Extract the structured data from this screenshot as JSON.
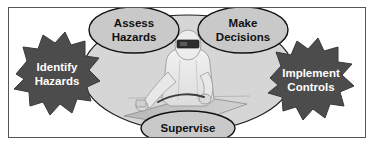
{
  "diagram": {
    "frame": {
      "border_color": "#555555",
      "background_color": "#ffffff"
    },
    "center": {
      "oval_fill": "#d6d6d6",
      "figure_name": "welder-illustration",
      "figure_description": "Welder in protective suit with dark welding visor working at a table"
    },
    "nodes": [
      {
        "id": "assess-hazards",
        "shape": "ellipse",
        "line1": "Assess",
        "line2": "Hazards",
        "fill": "#c9c9c9",
        "text_color": "#111111",
        "position": "top-left"
      },
      {
        "id": "make-decisions",
        "shape": "ellipse",
        "line1": "Make",
        "line2": "Decisions",
        "fill": "#c9c9c9",
        "text_color": "#111111",
        "position": "top-right"
      },
      {
        "id": "identify-hazards",
        "shape": "starburst",
        "line1": "Identify",
        "line2": "Hazards",
        "fill": "#4c4c4c",
        "text_color": "#ffffff",
        "position": "left"
      },
      {
        "id": "implement-controls",
        "shape": "starburst",
        "line1": "Implement",
        "line2": "Controls",
        "fill": "#4c4c4c",
        "text_color": "#ffffff",
        "position": "right"
      },
      {
        "id": "supervise",
        "shape": "ellipse",
        "line1": "Supervise",
        "line2": "",
        "fill": "#c9c9c9",
        "text_color": "#111111",
        "position": "bottom"
      }
    ]
  }
}
